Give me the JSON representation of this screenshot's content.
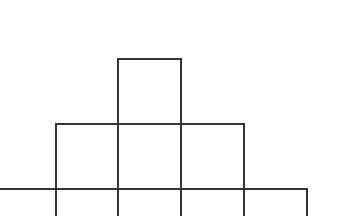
{
  "diagram": {
    "stroke_color": "#333333",
    "background": "#ffffff",
    "rows": [
      {
        "name": "top",
        "squares": [
          {
            "x": 118,
            "y": 59,
            "w": 63,
            "h": 65
          }
        ]
      },
      {
        "name": "middle",
        "squares": [
          {
            "x": 56,
            "y": 124,
            "w": 62,
            "h": 65
          },
          {
            "x": 118,
            "y": 124,
            "w": 63,
            "h": 65
          },
          {
            "x": 181,
            "y": 124,
            "w": 63,
            "h": 65
          }
        ]
      },
      {
        "name": "bottom",
        "squares": [
          {
            "x": -8,
            "y": 189,
            "w": 64,
            "h": 40
          },
          {
            "x": 56,
            "y": 189,
            "w": 62,
            "h": 40
          },
          {
            "x": 118,
            "y": 189,
            "w": 63,
            "h": 40
          },
          {
            "x": 181,
            "y": 189,
            "w": 63,
            "h": 40
          },
          {
            "x": 244,
            "y": 189,
            "w": 63,
            "h": 40
          }
        ]
      }
    ]
  }
}
